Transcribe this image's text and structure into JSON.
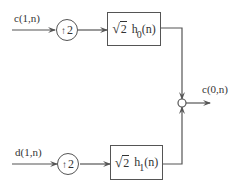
{
  "diagram": {
    "type": "synthesis filter bank (one stage)",
    "top_branch": {
      "input_label": "c(1,n)",
      "upsampler": {
        "arrow": "↑",
        "factor": "2"
      },
      "filter": {
        "gain": "2",
        "gain_symbol": "√",
        "name": "h",
        "subscript": "0",
        "arg": "(n)"
      }
    },
    "bottom_branch": {
      "input_label": "d(1,n)",
      "upsampler": {
        "arrow": "↑",
        "factor": "2"
      },
      "filter": {
        "gain": "2",
        "gain_symbol": "√",
        "name": "h",
        "subscript": "1",
        "arg": "(n)"
      }
    },
    "output": {
      "label": "c(0,n)"
    },
    "colors": {
      "line": "#555555",
      "text": "#333333",
      "background": "#ffffff"
    }
  }
}
